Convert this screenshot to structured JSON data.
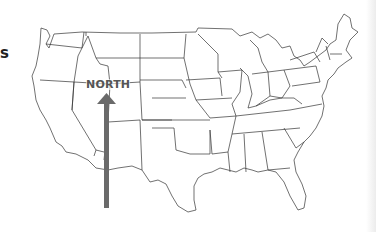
{
  "page": {
    "edge_text": "s",
    "north_label": "NORTH",
    "arrow_color": "#6a6a6a",
    "outline_color": "#333333"
  },
  "map": {
    "subject": "United States outline map with state boundaries",
    "annotation": {
      "label": "NORTH",
      "icon": "north-arrow-icon",
      "direction": "up"
    }
  }
}
